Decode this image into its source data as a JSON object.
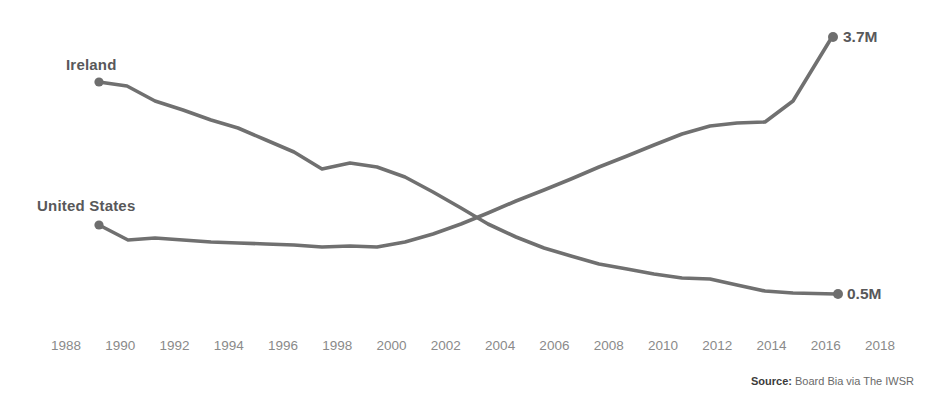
{
  "chart_data": {
    "type": "line",
    "title": "",
    "subtitle": "",
    "xlabel": "",
    "ylabel": "",
    "grid": false,
    "legend_position": "inline-left-labels",
    "xlim": [
      1988,
      2018
    ],
    "x_tick_labels": [
      "1988",
      "1990",
      "1992",
      "1994",
      "1996",
      "1998",
      "2000",
      "2002",
      "2004",
      "2006",
      "2008",
      "2010",
      "2012",
      "2014",
      "2016",
      "2018"
    ],
    "x": [
      1990,
      1991,
      1992,
      1993,
      1994,
      1995,
      1996,
      1997,
      1998,
      1999,
      2000,
      2001,
      2002,
      2003,
      2004,
      2005,
      2006,
      2007,
      2008,
      2009,
      2010,
      2011,
      2012,
      2013,
      2014,
      2015,
      2016
    ],
    "series": [
      {
        "name": "Ireland",
        "color": "#707070",
        "end_value_label": "0.5M",
        "start_label_position": "top-left",
        "values": [
          3.78,
          3.72,
          3.45,
          3.32,
          3.12,
          2.95,
          2.78,
          2.58,
          2.34,
          2.42,
          2.36,
          2.22,
          2.02,
          1.8,
          1.58,
          1.42,
          1.28,
          1.15,
          1.02,
          0.95,
          0.88,
          0.82,
          0.8,
          0.72,
          0.6,
          0.55,
          0.5
        ]
      },
      {
        "name": "United States",
        "color": "#707070",
        "end_value_label": "3.7M",
        "start_label_position": "mid-left",
        "values": [
          0.86,
          0.7,
          0.72,
          0.7,
          0.68,
          0.66,
          0.65,
          0.64,
          0.63,
          0.64,
          0.62,
          0.7,
          0.88,
          1.12,
          1.4,
          1.64,
          1.86,
          2.08,
          2.32,
          2.52,
          2.72,
          2.9,
          3.06,
          3.1,
          3.12,
          3.4,
          3.7
        ]
      }
    ],
    "annotations": [
      {
        "text": "3.7M",
        "series": "United States",
        "at_x": 2016
      },
      {
        "text": "0.5M",
        "series": "Ireland",
        "at_x": 2016
      }
    ]
  },
  "labels": {
    "ireland": "Ireland",
    "united_states": "United States",
    "value_top": "3.7M",
    "value_bottom": "0.5M"
  },
  "source": {
    "prefix": "Source:",
    "text": " Board Bia via The IWSR"
  },
  "colors": {
    "line": "#707070",
    "label_text": "#58585a",
    "axis_text": "#8a8a8a",
    "background": "#ffffff"
  }
}
